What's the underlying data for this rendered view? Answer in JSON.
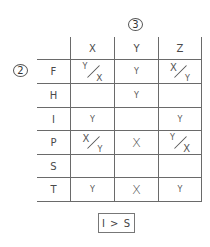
{
  "annotations": {
    "column_marker": "3",
    "row_marker": "2"
  },
  "columns": [
    "X",
    "Y",
    "Z"
  ],
  "rows": [
    {
      "label": "F",
      "cells": [
        {
          "type": "frac",
          "top": "Y",
          "bottom": "X"
        },
        {
          "type": "check",
          "value": "Y"
        },
        {
          "type": "frac",
          "top": "X",
          "bottom": "Y"
        }
      ]
    },
    {
      "label": "H",
      "cells": [
        {
          "type": "empty"
        },
        {
          "type": "check",
          "value": "Y"
        },
        {
          "type": "empty"
        }
      ]
    },
    {
      "label": "I",
      "cells": [
        {
          "type": "check",
          "value": "Y"
        },
        {
          "type": "empty"
        },
        {
          "type": "check",
          "value": "Y"
        }
      ]
    },
    {
      "label": "P",
      "cells": [
        {
          "type": "frac",
          "top": "X",
          "bottom": "Y"
        },
        {
          "type": "x",
          "value": "X"
        },
        {
          "type": "frac",
          "top": "Y",
          "bottom": "X"
        }
      ]
    },
    {
      "label": "S",
      "cells": [
        {
          "type": "empty"
        },
        {
          "type": "empty"
        },
        {
          "type": "empty"
        }
      ]
    },
    {
      "label": "T",
      "cells": [
        {
          "type": "check",
          "value": "Y"
        },
        {
          "type": "x",
          "value": "X"
        },
        {
          "type": "check",
          "value": "Y"
        }
      ]
    }
  ],
  "footer": {
    "constraint": "I > S"
  },
  "colors": {
    "line": "#6a6a6a",
    "text": "#4a4a4a"
  }
}
